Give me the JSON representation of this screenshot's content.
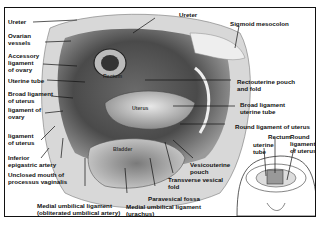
{
  "figure": {
    "colors": {
      "frame": "#111111",
      "background": "#ffffff",
      "ink": "#111111"
    }
  },
  "labels_left": [
    {
      "id": "ureter-left",
      "text": "Ureter"
    },
    {
      "id": "ovarian-vessels",
      "line1": "Ovarian",
      "line2": "vessels"
    },
    {
      "id": "accessory-ligament",
      "line1": "Accessory",
      "line2": "ligament",
      "line3": "of ovary"
    },
    {
      "id": "uterine-tube-left",
      "text": "Uterine tube"
    },
    {
      "id": "broad-ligament",
      "line1": "Broad ligament",
      "line2": "of uterus"
    },
    {
      "id": "ligament-of-ovary",
      "line1": "ligament of",
      "line2": "ovary"
    },
    {
      "id": "ligament-of-uterus",
      "line1": "ligament",
      "line2": "of uterus"
    },
    {
      "id": "inferior-epigastric",
      "line1": "Inferior",
      "line2": "epigastric artery"
    },
    {
      "id": "unclosed-mouth",
      "line1": "Unclosed mouth of",
      "line2": "processus vaginalis"
    }
  ],
  "labels_top": [
    {
      "id": "ureter-top",
      "text": "Ureter"
    },
    {
      "id": "sigmoid-mesocolon",
      "text": "Sigmoid mesocolon"
    }
  ],
  "labels_right": [
    {
      "id": "rectouterine-pouch",
      "line1": "Rectouterine pouch",
      "line2": "and fold"
    },
    {
      "id": "broad-ligament-tube",
      "line1": "Broad ligament",
      "line2": "uterine tube"
    },
    {
      "id": "round-ligament",
      "text": "Round ligament of uterus"
    }
  ],
  "labels_bottom": [
    {
      "id": "vesicouterine-pouch",
      "line1": "Vesicouterine",
      "line2": "pouch"
    },
    {
      "id": "transverse-vesical-fold",
      "line1": "Transverse vesical",
      "line2": "fold"
    },
    {
      "id": "paravesical-fossa",
      "text": "Paravesical fossa"
    },
    {
      "id": "medial-umbilical-urachus",
      "line1": "Medial umbilical ligament",
      "line2": "(urachus)"
    },
    {
      "id": "medial-umbilical-artery",
      "line1": "Medial umbilical ligament",
      "line2": "(obliterated umbilical artery)"
    }
  ],
  "organ_labels": {
    "rectum": "Rectum",
    "uterus": "Uterus",
    "bladder": "Bladder"
  },
  "inset": {
    "rectum": "Rectum",
    "uterine_tube": {
      "line1": "uterine",
      "line2": "tube"
    },
    "round_ligament": {
      "line1": "Round",
      "line2": "ligament",
      "line3": "of uterus"
    }
  }
}
